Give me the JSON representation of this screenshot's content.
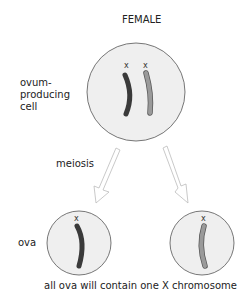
{
  "title": "FEMALE",
  "labels": {
    "parent_cell": [
      "ovum-",
      "producing",
      "cell"
    ],
    "process": "meiosis",
    "gametes": "ova",
    "caption": "all ova will contain one X chromosome"
  },
  "chromosome_labels": {
    "parent_left": "x",
    "parent_right": "x",
    "ovum_left": "x",
    "ovum_right": "x"
  },
  "colors": {
    "cell_fill": "#efefef",
    "cell_stroke": "#555555",
    "chromosome_dark": "#3a3a3a",
    "chromosome_light": "#9a9a9a",
    "arrow_stroke": "#bbbbbb"
  }
}
